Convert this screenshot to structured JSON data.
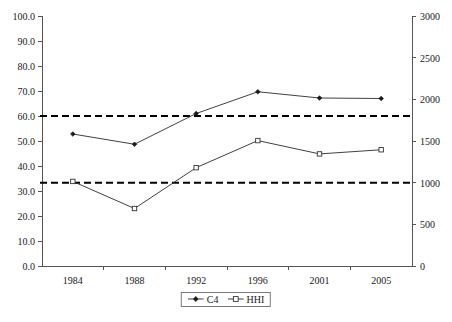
{
  "chart_data": {
    "type": "line",
    "title": "",
    "subtitle": "",
    "xlabel": "",
    "ylabel": "",
    "y2label": "",
    "categories": [
      "1984",
      "1988",
      "1992",
      "1996",
      "2001",
      "2005"
    ],
    "series": [
      {
        "name": "C4",
        "axis": "left",
        "marker": "filled-diamond",
        "values": [
          52.8,
          48.7,
          61.0,
          69.7,
          67.2,
          67.0
        ]
      },
      {
        "name": "HHI",
        "axis": "right",
        "marker": "open-square",
        "values": [
          1015,
          690,
          1180,
          1505,
          1345,
          1395
        ]
      }
    ],
    "reference_lines": [
      {
        "name": "upper-threshold",
        "axis": "right",
        "value": 1800,
        "left_axis_equivalent": 60.9,
        "style": "dashed"
      },
      {
        "name": "lower-threshold",
        "axis": "right",
        "value": 1000,
        "left_axis_equivalent": 33.6,
        "style": "dashed"
      }
    ],
    "ylim": [
      0,
      100
    ],
    "y2lim": [
      0,
      3000
    ],
    "ytick_labels": [
      "0.0",
      "10.0",
      "20.0",
      "30.0",
      "40.0",
      "50.0",
      "60.0",
      "70.0",
      "80.0",
      "90.0",
      "100.0"
    ],
    "ytick_values": [
      0,
      10,
      20,
      30,
      40,
      50,
      60,
      70,
      80,
      90,
      100
    ],
    "y2tick_labels": [
      "0",
      "500",
      "1000",
      "1500",
      "2000",
      "2500",
      "3000"
    ],
    "y2tick_values": [
      0,
      500,
      1000,
      1500,
      2000,
      2500,
      3000
    ],
    "grid": false,
    "legend_position": "bottom-center",
    "legend_entries": [
      "C4",
      "HHI"
    ],
    "series_line_color": "#2b2b2b",
    "reference_line_color": "#000000",
    "axis_color": "#555555"
  }
}
